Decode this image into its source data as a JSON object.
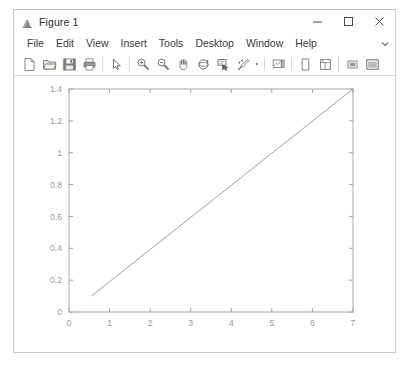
{
  "window": {
    "title": "Figure 1",
    "app_icon": "matlab-membrane-icon",
    "controls": [
      {
        "name": "minimize",
        "glyph": "minimize-icon"
      },
      {
        "name": "maximize",
        "glyph": "maximize-icon"
      },
      {
        "name": "close",
        "glyph": "close-icon"
      }
    ]
  },
  "menubar": {
    "items": [
      {
        "label": "File"
      },
      {
        "label": "Edit"
      },
      {
        "label": "View"
      },
      {
        "label": "Insert"
      },
      {
        "label": "Tools"
      },
      {
        "label": "Desktop"
      },
      {
        "label": "Window"
      },
      {
        "label": "Help"
      }
    ],
    "overflow_icon": "chevron-down-icon"
  },
  "toolbar": {
    "buttons": [
      {
        "name": "new-figure",
        "icon": "new-document-icon"
      },
      {
        "name": "open-file",
        "icon": "open-folder-icon"
      },
      {
        "name": "save-figure",
        "icon": "save-floppy-icon"
      },
      {
        "name": "print-figure",
        "icon": "printer-icon"
      },
      {
        "name": "edit-plot",
        "icon": "pointer-arrow-icon"
      },
      {
        "name": "zoom-in",
        "icon": "zoom-in-icon"
      },
      {
        "name": "zoom-out",
        "icon": "zoom-out-icon"
      },
      {
        "name": "pan",
        "icon": "hand-pan-icon"
      },
      {
        "name": "rotate-3d",
        "icon": "rotate-3d-icon"
      },
      {
        "name": "data-cursor",
        "icon": "data-cursor-icon"
      },
      {
        "name": "brush-select",
        "icon": "brush-select-icon"
      },
      {
        "name": "link-plot",
        "icon": "link-dot-icon"
      },
      {
        "name": "insert-colorbar",
        "icon": "colorbar-icon"
      },
      {
        "name": "insert-legend",
        "icon": "legend-icon"
      },
      {
        "name": "hide-plot-tools",
        "icon": "plot-browser-icon"
      },
      {
        "name": "show-plot-tools-docked",
        "icon": "property-editor-icon"
      },
      {
        "name": "show-plot-tools",
        "icon": "figure-palette-icon"
      }
    ]
  },
  "chart_data": {
    "type": "line",
    "title": "",
    "xlabel": "",
    "ylabel": "",
    "xlim": [
      0,
      7
    ],
    "ylim": [
      0,
      1.4
    ],
    "xticks": [
      0,
      1,
      2,
      3,
      4,
      5,
      6,
      7
    ],
    "xtick_labels": [
      "0",
      "1",
      "2",
      "3",
      "4",
      "5",
      "6",
      "7"
    ],
    "yticks": [
      0,
      0.2,
      0.4,
      0.6,
      0.8,
      1,
      1.2,
      1.4
    ],
    "ytick_labels": [
      "0",
      "0.2",
      "0.4",
      "0.6",
      "0.8",
      "1",
      "1.2",
      "1.4"
    ],
    "grid": false,
    "legend": null,
    "box": true,
    "line_color": "#8a8a8a",
    "line_width": 0.8,
    "series": [
      {
        "name": "line1",
        "x": [
          0.55,
          7.0
        ],
        "y": [
          0.1,
          1.4
        ]
      }
    ]
  },
  "colors": {
    "window_border": "#c9c9c9",
    "axes_line": "#a6a6a6",
    "tick_text": "#9a9a9a",
    "canvas_bg": "#ffffff"
  }
}
